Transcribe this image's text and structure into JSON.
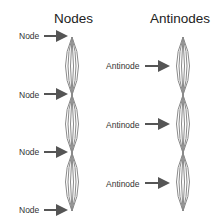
{
  "titles": {
    "left": "Nodes",
    "right": "Antinodes"
  },
  "left_labels": [
    "Node",
    "Node",
    "Node",
    "Node"
  ],
  "right_labels": [
    "Antinode",
    "Antinode",
    "Antinode"
  ],
  "colors": {
    "wave": "#8a8a8a",
    "arrow": "#555555",
    "text": "#222222"
  }
}
